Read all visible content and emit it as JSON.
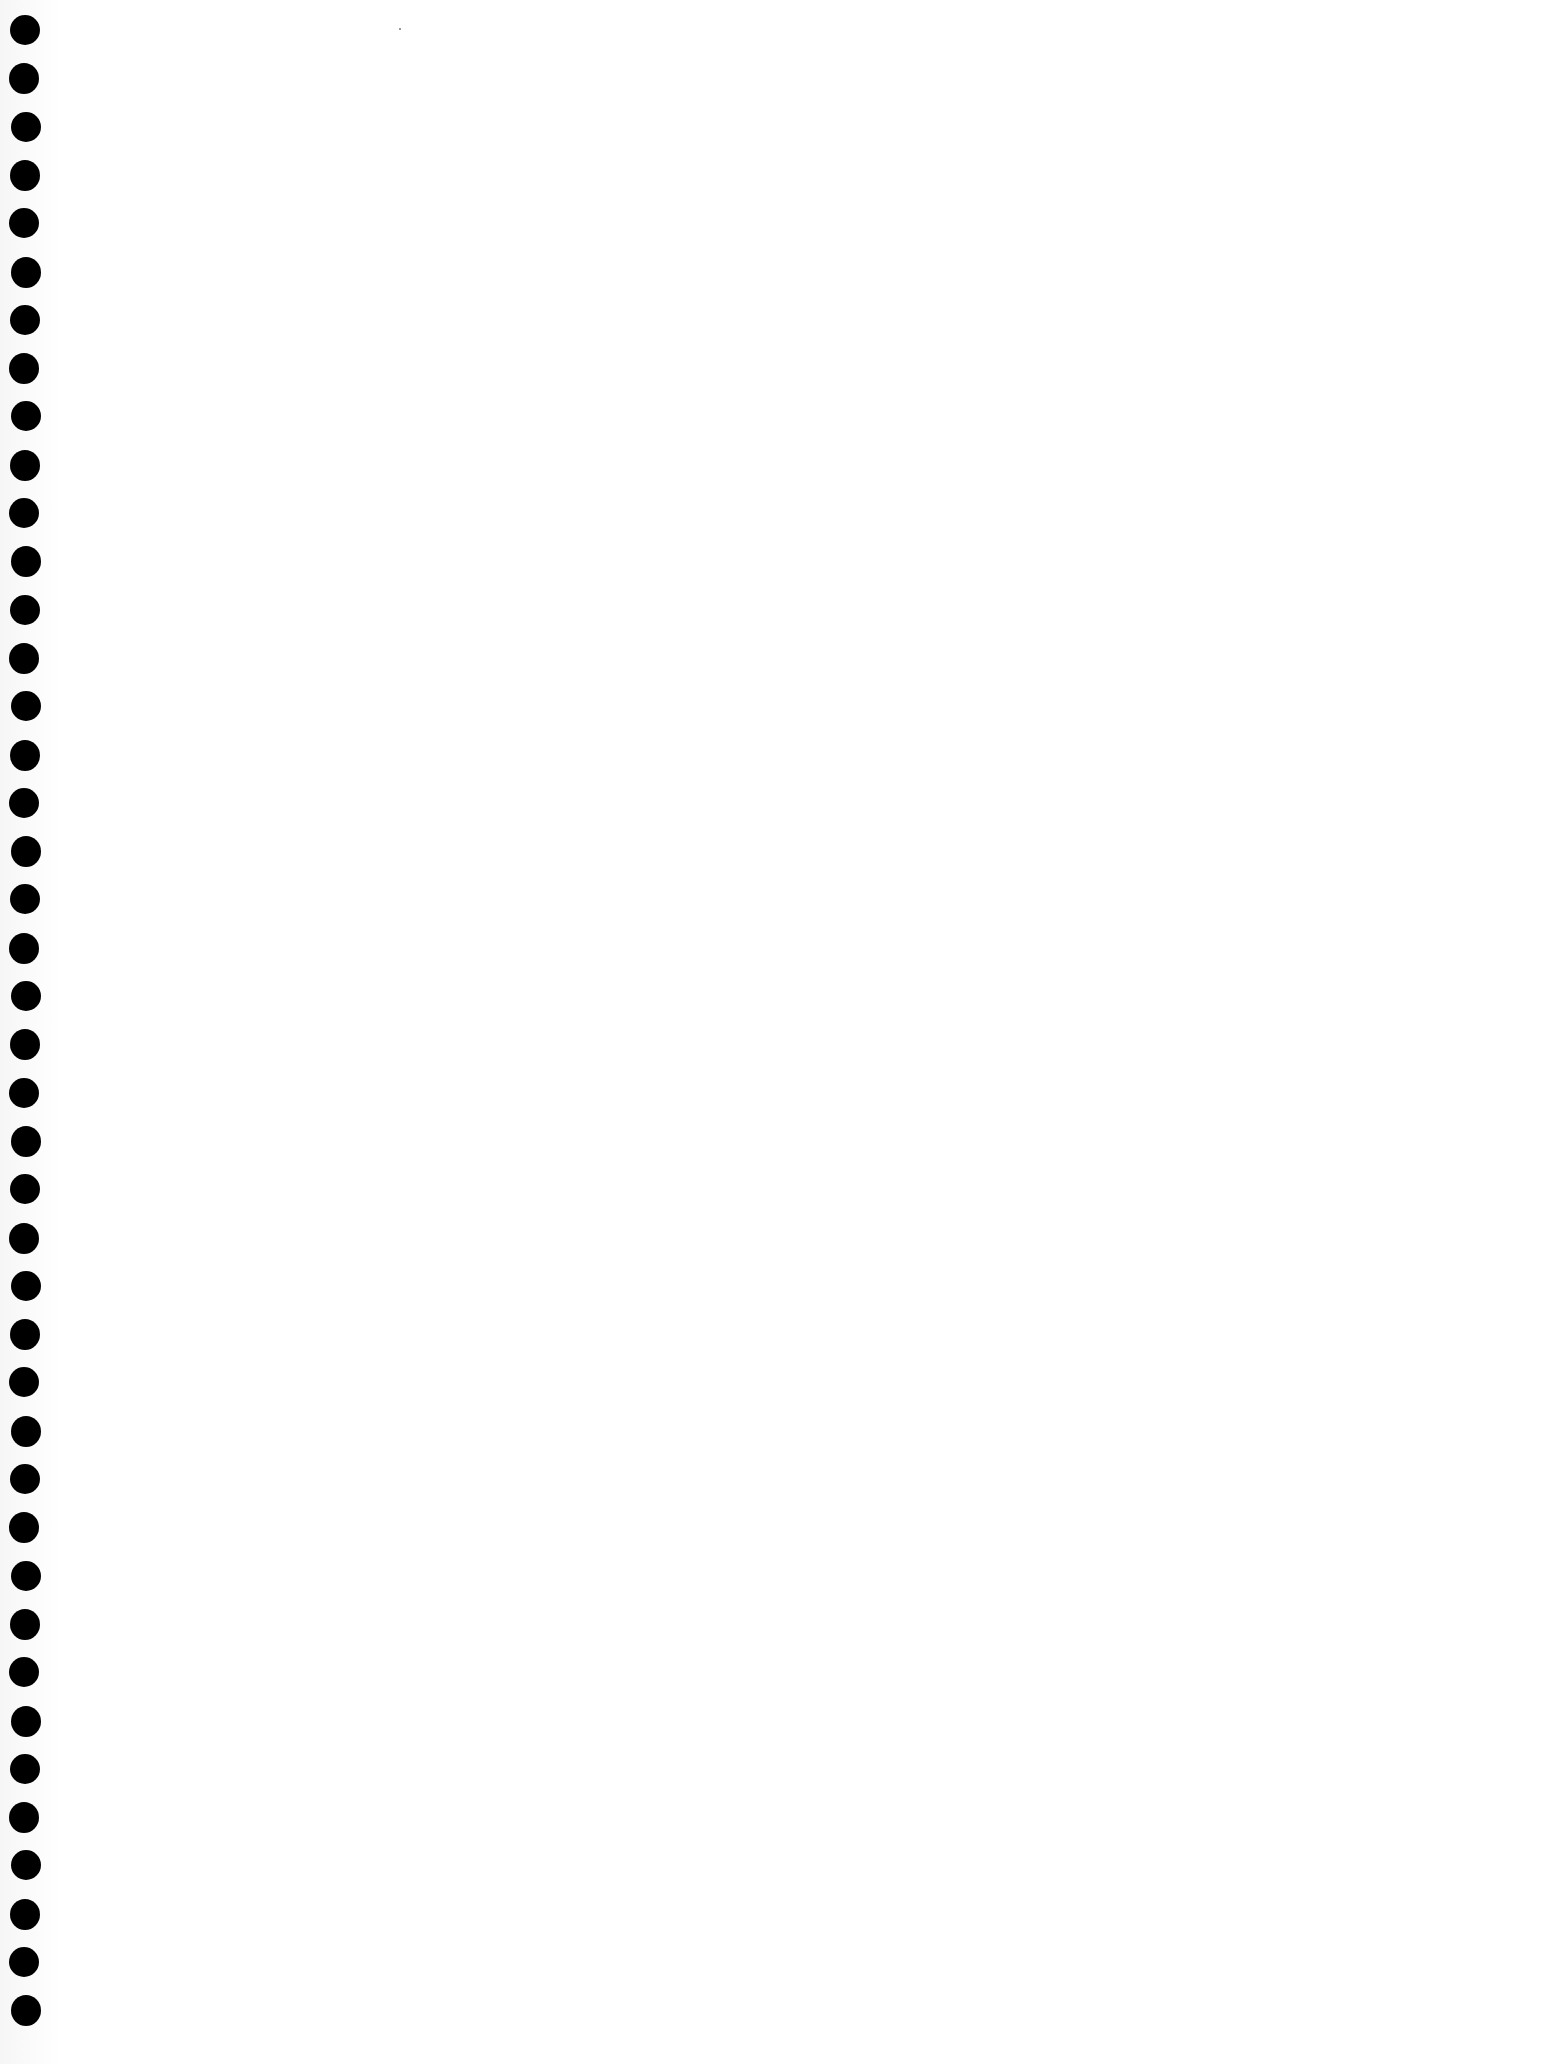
{
  "page": {
    "type": "blank notebook page",
    "background_color": "#ffffff",
    "hole_color": "#000000",
    "binding": {
      "side": "left",
      "hole_count": 42,
      "first_hole_y": 30,
      "spacing_px": 48.3,
      "hole_center_x": 24,
      "hole_diameter_px": 30
    }
  }
}
